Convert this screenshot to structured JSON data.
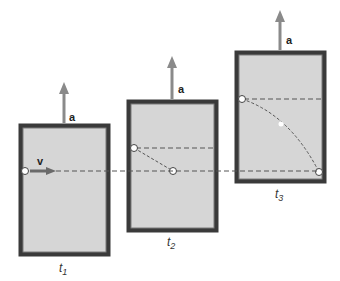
{
  "diagram": {
    "colors": {
      "frame": "#3a3a3a",
      "fill": "#d6d6d6",
      "arrow": "#8a8a8a",
      "dash": "#555555",
      "background": "#ffffff"
    },
    "frames": [
      {
        "id": "t1",
        "time_label": "t",
        "time_sub": "1",
        "accel_label": "a",
        "velocity_label": "v"
      },
      {
        "id": "t2",
        "time_label": "t",
        "time_sub": "2",
        "accel_label": "a"
      },
      {
        "id": "t3",
        "time_label": "t",
        "time_sub": "3",
        "accel_label": "a"
      }
    ]
  }
}
